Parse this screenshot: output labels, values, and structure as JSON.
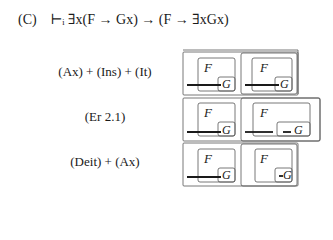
{
  "header": {
    "label": "(C)",
    "formula": "⊢ᵢ ∃x(F → Gx) → (F → ∃xGx)"
  },
  "rows": [
    {
      "label": "(Ax) + (Ins) + (It)",
      "left": {
        "f": "F",
        "g": "G"
      },
      "right": {
        "f": "F",
        "g": "G"
      }
    },
    {
      "label": "(Er 2.1)",
      "left": {
        "f": "F",
        "g": "G"
      },
      "right": {
        "f": "F",
        "g": "G"
      }
    },
    {
      "label": "(Deit) + (Ax)",
      "left": {
        "f": "F",
        "g": "G"
      },
      "right": {
        "f": "F",
        "g": "G"
      }
    }
  ],
  "colors": {
    "stroke": "#555555",
    "line": "#1a1a1a",
    "text": "#1a1a1a"
  }
}
